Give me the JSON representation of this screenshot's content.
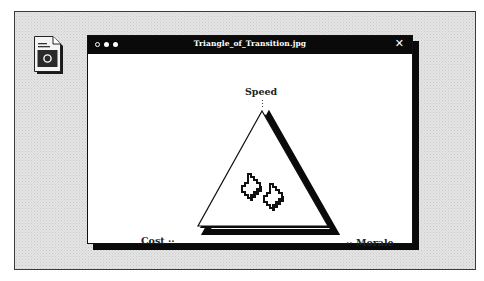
{
  "desktop": {
    "background": "#e4e4e4",
    "icons": [
      {
        "name": "image-file",
        "icon": "image-document-icon"
      }
    ]
  },
  "window": {
    "title": "Triangle_of_Transition.jpg",
    "controls": {
      "dots": [
        "hollow",
        "filled",
        "filled"
      ],
      "close_label": "✕"
    },
    "titlebar_color": "#0a0a0a",
    "shadow_color": "#0a0a0a"
  },
  "image": {
    "type": "diagram",
    "shape": "triangle",
    "vertices": [
      {
        "position": "top",
        "label": "Speed"
      },
      {
        "position": "bottom-left",
        "label": "Cost"
      },
      {
        "position": "bottom-right",
        "label": "Morale"
      }
    ],
    "center_icon": "two-pixel-arrows-icon",
    "labels": {
      "speed": "Speed",
      "cost": "Cost",
      "morale": "Morale",
      "cost_leader": "··",
      "morale_leader": "··"
    }
  }
}
